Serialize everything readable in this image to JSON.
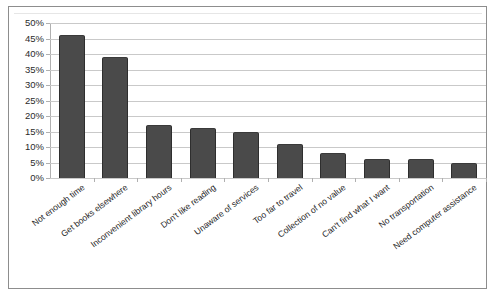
{
  "chart_data": {
    "type": "bar",
    "title": "",
    "subtitle": "",
    "xlabel": "",
    "ylabel": "",
    "grid": true,
    "legend": false,
    "ylim": [
      0,
      50
    ],
    "y_tick_labels": [
      "50%",
      "45%",
      "40%",
      "35%",
      "30%",
      "25%",
      "20%",
      "15%",
      "10%",
      "5%",
      "0%"
    ],
    "y_tick_values": [
      50,
      45,
      40,
      35,
      30,
      25,
      20,
      15,
      10,
      5,
      0
    ],
    "categories": [
      "Not enough time",
      "Get books elsewhere",
      "Inconvenient library hours",
      "Don't like reading",
      "Unaware of services",
      "Too far to travel",
      "Collection of no value",
      "Can't find what I want",
      "No transportation",
      "Need computer assistance"
    ],
    "values": [
      46,
      39,
      17,
      16,
      15,
      11,
      8,
      6,
      6,
      5
    ],
    "bar_color": "#4a4a4a",
    "gridline_color": "#c9c9c9",
    "plot_background": "#ffffff",
    "frame_border_color": "#8d8d8d"
  }
}
